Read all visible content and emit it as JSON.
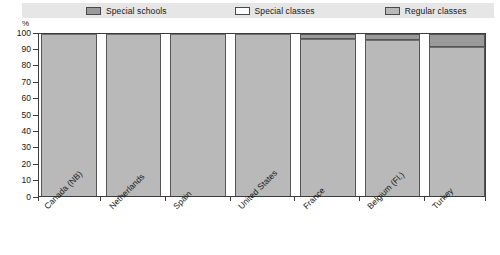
{
  "unit_label": "%",
  "legend": {
    "items": [
      {
        "label": "Special schools",
        "color": "#9a9a9a",
        "key": "special_schools"
      },
      {
        "label": "Special classes",
        "color": "#fdfdfd",
        "key": "special_classes"
      },
      {
        "label": "Regular classes",
        "color": "#b9b9b9",
        "key": "regular_classes"
      }
    ]
  },
  "y_axis": {
    "ticks": [
      "100",
      "90",
      "80",
      "70",
      "60",
      "50",
      "40",
      "30",
      "20",
      "10",
      "0"
    ]
  },
  "colors": {
    "special_schools": "#9a9a9a",
    "special_classes": "#fdfdfd",
    "regular_classes": "#b9b9b9",
    "legend_background": "#e6e6e6",
    "axis": "#3c3c3c"
  },
  "chart_data": {
    "type": "bar",
    "stacked": true,
    "title": "",
    "subtitle": "",
    "xlabel": "",
    "ylabel": "%",
    "ylim": [
      0,
      100
    ],
    "yticks": [
      0,
      10,
      20,
      30,
      40,
      50,
      60,
      70,
      80,
      90,
      100
    ],
    "grid": false,
    "legend_position": "top",
    "categories": [
      "Canada (NB)",
      "Netherlands",
      "Spain",
      "United States",
      "France",
      "Belgium (Fl.)",
      "Turkey"
    ],
    "series": [
      {
        "name": "Regular classes",
        "values": [
          100,
          100,
          100,
          100,
          97,
          96,
          92
        ]
      },
      {
        "name": "Special classes",
        "values": [
          0,
          0,
          0,
          0,
          0,
          0,
          0
        ]
      },
      {
        "name": "Special schools",
        "values": [
          0,
          0,
          0,
          0,
          3,
          4,
          8
        ]
      }
    ]
  }
}
